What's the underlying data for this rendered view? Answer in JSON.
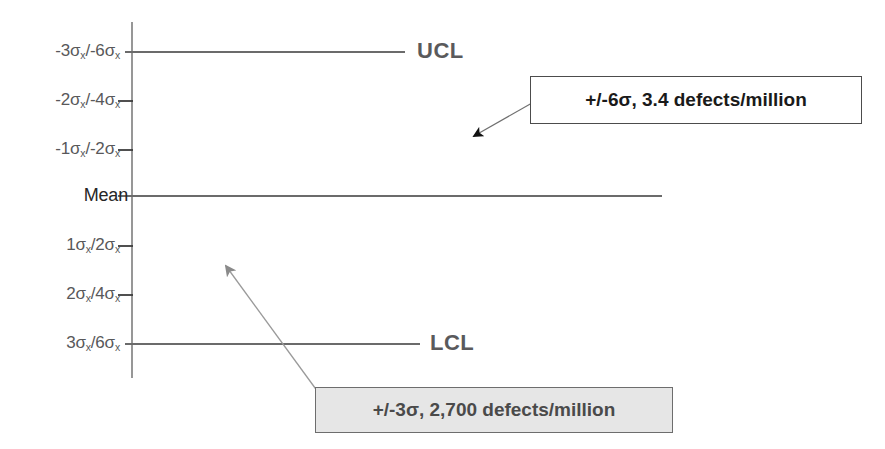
{
  "figure": {
    "title_visible": false,
    "colors": {
      "background": "#ffffff",
      "axis_line": "#6b6b6b",
      "limit_line": "#6b6b6b",
      "narrow_curve_stroke": "#8a8a8a",
      "narrow_curve_fill": "#d9d9d9",
      "dotted_curve": "#111111",
      "axis_label_text": "#58585a",
      "mean_label_text": "#262626",
      "limit_label_text": "#5a5a5c",
      "callout_six_border": "#4c4c4c",
      "callout_six_bg": "#ffffff",
      "callout_six_text": "#1a1a1a",
      "callout_three_border": "#6d6d6d",
      "callout_three_bg": "#e6e6e6",
      "callout_three_text": "#4a4a4a",
      "arrow_six": "#111111",
      "arrow_three": "#8a8a8a"
    },
    "axis_labels": [
      {
        "id": "minus-3-6",
        "text": "-3σₓ/-6σₓ",
        "main": "-3σ",
        "sub1": "x",
        "mid": "/-6σ",
        "sub2": "x",
        "y": 52,
        "has_tick": true
      },
      {
        "id": "minus-2-4",
        "text": "-2σₓ/-4σₓ",
        "main": "-2σ",
        "sub1": "x",
        "mid": "/-4σ",
        "sub2": "x",
        "y": 101,
        "has_tick": true
      },
      {
        "id": "minus-1-2",
        "text": "-1σₓ/-2σₓ",
        "main": "-1σ",
        "sub1": "x",
        "mid": "/-2σ",
        "sub2": "x",
        "y": 150,
        "has_tick": true
      },
      {
        "id": "mean",
        "text": "Mean",
        "main": "Mean",
        "sub1": "",
        "mid": "",
        "sub2": "",
        "y": 196,
        "has_tick": false
      },
      {
        "id": "plus-1-2",
        "text": "1σₓ/2σₓ",
        "main": "1σ",
        "sub1": "x",
        "mid": "/2σ",
        "sub2": "x",
        "y": 246,
        "has_tick": true
      },
      {
        "id": "plus-2-4",
        "text": "2σₓ/4σₓ",
        "main": "2σ",
        "sub1": "x",
        "mid": "/4σ",
        "sub2": "x",
        "y": 295,
        "has_tick": true
      },
      {
        "id": "plus-3-6",
        "text": "3σₓ/6σₓ",
        "main": "3σ",
        "sub1": "x",
        "mid": "/6σ",
        "sub2": "x",
        "y": 344,
        "has_tick": true
      }
    ],
    "limit_labels": [
      {
        "id": "ucl",
        "text": "UCL",
        "y": 52
      },
      {
        "id": "lcl",
        "text": "LCL",
        "y": 344
      }
    ],
    "callouts": [
      {
        "id": "six-sigma",
        "text": "+/-6σ, 3.4 defects/million",
        "x": 530,
        "y": 76,
        "width": 332,
        "height": 48,
        "style": "white"
      },
      {
        "id": "three-sigma",
        "text": "+/-3σ, 2,700 defects/million",
        "x": 315,
        "y": 387,
        "width": 358,
        "height": 46,
        "style": "gray"
      }
    ]
  },
  "chart_data": {
    "type": "line",
    "title": "",
    "subtitle": "",
    "xlabel": "",
    "ylabel": "",
    "orientation": "horizontal-bell (density on x-axis, sigma on y-axis)",
    "grid": false,
    "legend": "none",
    "axis_x_position": 132,
    "axis_y_range": [
      25,
      375
    ],
    "mean_y": 196,
    "sigma_spacing_px": 49,
    "y_tick_labels": [
      "-3σₓ/-6σₓ",
      "-2σₓ/-4σₓ",
      "-1σₓ/-2σₓ",
      "Mean",
      "1σₓ/2σₓ",
      "2σₓ/4σₓ",
      "3σₓ/6σₓ"
    ],
    "y_tick_values": [
      -3,
      -2,
      -1,
      0,
      1,
      2,
      3
    ],
    "series": [
      {
        "name": "+/-3σ process (narrow, shaded)",
        "style": "solid-filled",
        "stroke": "#8a8a8a",
        "fill": "#d9d9d9",
        "peak_x": 268,
        "base_x": 132,
        "sigma_px": 49,
        "spread_sigma": 1.0,
        "defects_per_million": 2700,
        "sigma_level": 3
      },
      {
        "name": "+/-6σ process (wide, dotted)",
        "style": "dotted",
        "stroke": "#111111",
        "peak_x": 655,
        "base_x": 132,
        "sigma_px": 49,
        "spread_sigma": 2.0,
        "defects_per_million": 3.4,
        "sigma_level": 6
      }
    ],
    "limit_lines": [
      {
        "name": "UCL",
        "y": 52,
        "x_start": 125,
        "x_end": 405,
        "label": "UCL"
      },
      {
        "name": "Mean",
        "y": 196,
        "x_start": 118,
        "x_end": 662,
        "label": "Mean"
      },
      {
        "name": "LCL",
        "y": 344,
        "x_start": 125,
        "x_end": 420,
        "label": "LCL"
      }
    ],
    "annotations": [
      {
        "text": "+/-6σ, 3.4 defects/million",
        "points_to": [
          470,
          138
        ]
      },
      {
        "text": "+/-3σ, 2,700 defects/million",
        "points_to": [
          222,
          264
        ]
      }
    ]
  }
}
